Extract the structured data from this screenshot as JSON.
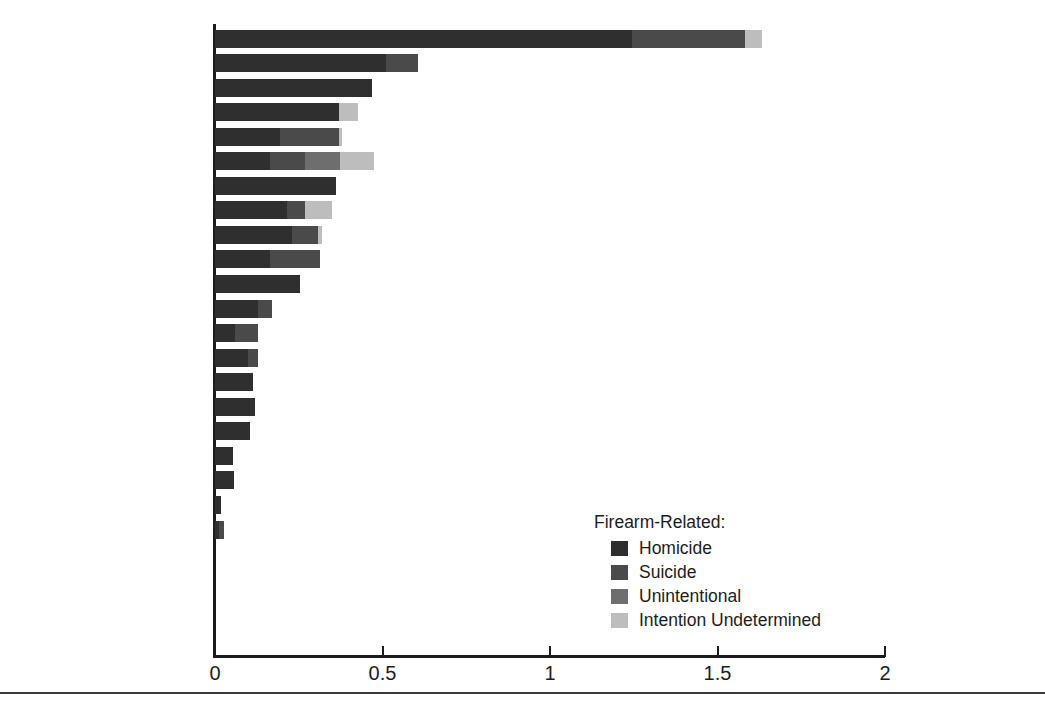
{
  "chart_data": {
    "type": "bar",
    "orientation": "horizontal",
    "stacked": true,
    "title": "",
    "subtitle": "",
    "xlabel": "",
    "ylabel": "",
    "xlim": [
      0,
      2
    ],
    "xticks": [
      0,
      0.5,
      1,
      1.5,
      2
    ],
    "xtick_labels": [
      "0",
      "0.5",
      "1",
      "1.5",
      "2"
    ],
    "grid": false,
    "legend_position": "inside-lower-right",
    "legend_title": "Firearm-Related:",
    "series": [
      {
        "name": "Homicide",
        "color": "#2f2f2f",
        "values": [
          1.245,
          0.51,
          0.47,
          0.37,
          0.194,
          0.164,
          0.362,
          0.215,
          0.23,
          0.164,
          0.254,
          0.128,
          0.06,
          0.099,
          0.114,
          0.119,
          0.104,
          0.054,
          0.057,
          0.018,
          0.012,
          0,
          0,
          0,
          0,
          0
        ]
      },
      {
        "name": "Suicide",
        "color": "#4a4a4a",
        "values": [
          0.337,
          0.097,
          0.0,
          0.0,
          0.176,
          0.104,
          0.0,
          0.054,
          0.078,
          0.149,
          0.0,
          0.042,
          0.069,
          0.03,
          0.0,
          0.0,
          0.0,
          0.0,
          0.0,
          0.0,
          0.015,
          0,
          0,
          0,
          0,
          0
        ]
      },
      {
        "name": "Unintentional",
        "color": "#6e6e6e",
        "values": [
          0.0,
          0.0,
          0.0,
          0.0,
          0.0,
          0.104,
          0.0,
          0.0,
          0.0,
          0.0,
          0.0,
          0.0,
          0.0,
          0.0,
          0.0,
          0.0,
          0.0,
          0.0,
          0.0,
          0.0,
          0.0,
          0,
          0,
          0,
          0,
          0
        ]
      },
      {
        "name": "Intention Undetermined",
        "color": "#bdbdbd",
        "values": [
          0.05,
          0.0,
          0.0,
          0.057,
          0.009,
          0.104,
          0.0,
          0.081,
          0.012,
          0.0,
          0.0,
          0.0,
          0.0,
          0.0,
          0.0,
          0.0,
          0.0,
          0.0,
          0.0,
          0.0,
          0.0,
          0,
          0,
          0,
          0,
          0
        ]
      }
    ],
    "categories": [
      "United States",
      "Finland",
      "Northern Ireland",
      "Israel",
      "Canada",
      "Belgium",
      "Norway",
      "Austria",
      "France",
      "Switzerland",
      "New Zealand",
      "Australia",
      "Sweden",
      "Italy",
      "Germany",
      "Denmark",
      "Scotland",
      "England and Wales",
      "Ireland",
      "Spain",
      "Taiwan",
      "Hong Kong",
      "Netherlands",
      "Singapore",
      "Japan",
      "Kuwait"
    ],
    "category_footnotes": [
      "",
      "",
      "",
      "",
      "",
      "",
      "",
      "",
      "",
      "",
      "d",
      "",
      "",
      "",
      "",
      "d",
      "d",
      "",
      "d",
      "",
      "d",
      "",
      "",
      "",
      "",
      ""
    ],
    "totals": [
      1.632,
      0.607,
      0.47,
      0.427,
      0.379,
      0.476,
      0.362,
      0.35,
      0.32,
      0.313,
      0.254,
      0.17,
      0.129,
      0.129,
      0.114,
      0.119,
      0.104,
      0.054,
      0.057,
      0.018,
      0.027,
      0.0,
      0.0,
      0.0,
      0.0,
      0.0
    ]
  },
  "legend": {
    "title": "Firearm-Related:",
    "items": [
      {
        "label": "Homicide",
        "color": "#2f2f2f",
        "swatch": "legend-swatch-homicide"
      },
      {
        "label": "Suicide",
        "color": "#4a4a4a",
        "swatch": "legend-swatch-suicide"
      },
      {
        "label": "Unintentional",
        "color": "#6e6e6e",
        "swatch": "legend-swatch-unintentional"
      },
      {
        "label": "Intention Undetermined",
        "color": "#bdbdbd",
        "swatch": "legend-swatch-undetermined"
      }
    ]
  },
  "axis": {
    "tick_labels": [
      "0",
      "0.5",
      "1",
      "1.5",
      "2"
    ]
  }
}
